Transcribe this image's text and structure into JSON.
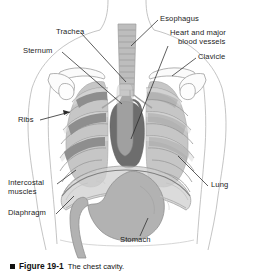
{
  "figure": {
    "caption_bullet": "■",
    "caption_number": "Figure 19-1",
    "caption_title": "The chest cavity."
  },
  "labels": {
    "trachea": "Trachea",
    "esophagus": "Esophagus",
    "heart_line1": "Heart and major",
    "heart_line2": "blood vessels",
    "clavicle": "Clavicle",
    "sternum": "Sternum",
    "ribs": "Ribs",
    "lung": "Lung",
    "intercostal_line1": "Intercostal",
    "intercostal_line2": "muscles",
    "diaphragm": "Diaphragm",
    "stomach": "Stomach"
  },
  "colors": {
    "background": "#ffffff",
    "outline": "#9a9a9a",
    "body_outline": "#b0b0b0",
    "lung": "#c4c4c4",
    "rib": "#d8d8d8",
    "rib_stroke": "#9d9d9d",
    "heart": "#6d6d6d",
    "trachea": "#bdbdbd",
    "trachea_band": "#a3a3a3",
    "intercostal": "#8e8e8e",
    "stomach": "#b2b2b2",
    "diaphragm": "#cfcfcf",
    "leader": "#2a2a2a",
    "text": "#1c1c1c"
  },
  "diagram": {
    "type": "anatomical-illustration",
    "parts": [
      "trachea",
      "esophagus",
      "heart and major blood vessels",
      "clavicle",
      "sternum",
      "ribs",
      "lung",
      "intercostal muscles",
      "diaphragm",
      "stomach"
    ]
  }
}
